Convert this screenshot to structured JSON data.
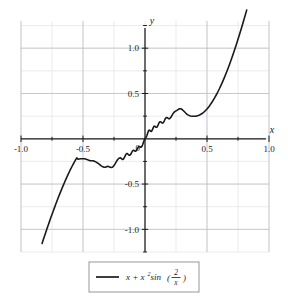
{
  "chart_data": {
    "type": "line",
    "title": "",
    "subtitle": "",
    "xlabel": "x",
    "ylabel": "y",
    "xlim": [
      -1.0,
      1.0
    ],
    "ylim": [
      -1.25,
      1.3
    ],
    "grid": true,
    "grid_major_step": 0.5,
    "grid_minor_step": 0.25,
    "legend_position": "bottom-center",
    "axes_style": "centered-cross",
    "xticks": [
      -1.0,
      -0.5,
      0.5,
      1.0
    ],
    "xtick_labels": [
      "-1.0",
      "-0.5",
      "0.5",
      "1.0"
    ],
    "yticks": [
      1.0,
      0.5,
      -0.5,
      -1.0
    ],
    "ytick_labels": [
      "1.0",
      "0.5",
      "-0.5",
      "-1.0"
    ],
    "origin_label": "0",
    "series": [
      {
        "name": "x + x^2 sin(2/x)",
        "color": "#1a1a1a",
        "linewidth": 1.6,
        "x_domain": [
          -0.83,
          0.82
        ],
        "formula_parts": {
          "lead": "x + x",
          "exponent": "2",
          "func": " sin",
          "frac_numerator": "2",
          "frac_denominator": "x"
        },
        "annotations": [
          {
            "label": "local maximum",
            "x": -0.42,
            "y": -0.24
          },
          {
            "label": "local minimum",
            "x": -0.26,
            "y": -0.31
          },
          {
            "label": "local maximum",
            "x": 0.28,
            "y": 0.33
          },
          {
            "label": "local minimum",
            "x": 0.42,
            "y": 0.25
          },
          {
            "label": "inflection near origin",
            "x": 0.0,
            "y": 0.0
          }
        ],
        "points": [
          [
            -0.83,
            -1.155
          ],
          [
            -0.82,
            -1.113
          ],
          [
            -0.81,
            -1.072
          ],
          [
            -0.8,
            -1.031
          ],
          [
            -0.79,
            -0.991
          ],
          [
            -0.78,
            -0.951
          ],
          [
            -0.77,
            -0.912
          ],
          [
            -0.76,
            -0.873
          ],
          [
            -0.75,
            -0.835
          ],
          [
            -0.74,
            -0.797
          ],
          [
            -0.73,
            -0.76
          ],
          [
            -0.72,
            -0.723
          ],
          [
            -0.71,
            -0.687
          ],
          [
            -0.7,
            -0.652
          ],
          [
            -0.69,
            -0.617
          ],
          [
            -0.68,
            -0.583
          ],
          [
            -0.67,
            -0.549
          ],
          [
            -0.66,
            -0.517
          ],
          [
            -0.65,
            -0.485
          ],
          [
            -0.64,
            -0.453
          ],
          [
            -0.63,
            -0.423
          ],
          [
            -0.62,
            -0.393
          ],
          [
            -0.61,
            -0.364
          ],
          [
            -0.6,
            -0.336
          ],
          [
            -0.59,
            -0.309
          ],
          [
            -0.58,
            -0.283
          ],
          [
            -0.57,
            -0.258
          ],
          [
            -0.56,
            -0.234
          ],
          [
            -0.55,
            -0.211
          ],
          [
            -0.54,
            -0.226
          ],
          [
            -0.53,
            -0.223
          ],
          [
            -0.52,
            -0.221
          ],
          [
            -0.51,
            -0.22
          ],
          [
            -0.5,
            -0.22
          ],
          [
            -0.49,
            -0.221
          ],
          [
            -0.48,
            -0.224
          ],
          [
            -0.47,
            -0.228
          ],
          [
            -0.46,
            -0.233
          ],
          [
            -0.45,
            -0.239
          ],
          [
            -0.44,
            -0.241
          ],
          [
            -0.43,
            -0.242
          ],
          [
            -0.42,
            -0.243
          ],
          [
            -0.41,
            -0.247
          ],
          [
            -0.4,
            -0.253
          ],
          [
            -0.39,
            -0.261
          ],
          [
            -0.38,
            -0.27
          ],
          [
            -0.37,
            -0.28
          ],
          [
            -0.36,
            -0.291
          ],
          [
            -0.35,
            -0.302
          ],
          [
            -0.34,
            -0.31
          ],
          [
            -0.33,
            -0.315
          ],
          [
            -0.32,
            -0.314
          ],
          [
            -0.31,
            -0.308
          ],
          [
            -0.3,
            -0.304
          ],
          [
            -0.29,
            -0.308
          ],
          [
            -0.28,
            -0.315
          ],
          [
            -0.27,
            -0.318
          ],
          [
            -0.26,
            -0.312
          ],
          [
            -0.25,
            -0.296
          ],
          [
            -0.24,
            -0.274
          ],
          [
            -0.23,
            -0.25
          ],
          [
            -0.22,
            -0.229
          ],
          [
            -0.21,
            -0.215
          ],
          [
            -0.2,
            -0.21
          ],
          [
            -0.195,
            -0.213
          ],
          [
            -0.19,
            -0.219
          ],
          [
            -0.185,
            -0.225
          ],
          [
            -0.18,
            -0.228
          ],
          [
            -0.175,
            -0.225
          ],
          [
            -0.17,
            -0.216
          ],
          [
            -0.165,
            -0.203
          ],
          [
            -0.16,
            -0.188
          ],
          [
            -0.155,
            -0.175
          ],
          [
            -0.15,
            -0.166
          ],
          [
            -0.145,
            -0.163
          ],
          [
            -0.14,
            -0.166
          ],
          [
            -0.135,
            -0.173
          ],
          [
            -0.13,
            -0.18
          ],
          [
            -0.125,
            -0.183
          ],
          [
            -0.12,
            -0.18
          ],
          [
            -0.115,
            -0.171
          ],
          [
            -0.11,
            -0.158
          ],
          [
            -0.105,
            -0.145
          ],
          [
            -0.1,
            -0.134
          ],
          [
            -0.095,
            -0.128
          ],
          [
            -0.09,
            -0.128
          ],
          [
            -0.085,
            -0.132
          ],
          [
            -0.08,
            -0.136
          ],
          [
            -0.075,
            -0.136
          ],
          [
            -0.07,
            -0.13
          ],
          [
            -0.065,
            -0.119
          ],
          [
            -0.06,
            -0.106
          ],
          [
            -0.055,
            -0.094
          ],
          [
            -0.05,
            -0.087
          ],
          [
            -0.045,
            -0.086
          ],
          [
            -0.04,
            -0.089
          ],
          [
            -0.035,
            -0.093
          ],
          [
            -0.03,
            -0.092
          ],
          [
            -0.025,
            -0.084
          ],
          [
            -0.02,
            -0.069
          ],
          [
            -0.015,
            -0.05
          ],
          [
            -0.01,
            -0.03
          ],
          [
            -0.005,
            -0.012
          ],
          [
            0.0,
            0.0
          ],
          [
            0.005,
            0.01
          ],
          [
            0.01,
            0.02
          ],
          [
            0.015,
            0.035
          ],
          [
            0.02,
            0.056
          ],
          [
            0.025,
            0.077
          ],
          [
            0.03,
            0.092
          ],
          [
            0.035,
            0.096
          ],
          [
            0.04,
            0.091
          ],
          [
            0.045,
            0.083
          ],
          [
            0.05,
            0.08
          ],
          [
            0.055,
            0.086
          ],
          [
            0.06,
            0.1
          ],
          [
            0.065,
            0.117
          ],
          [
            0.07,
            0.132
          ],
          [
            0.075,
            0.139
          ],
          [
            0.08,
            0.138
          ],
          [
            0.085,
            0.132
          ],
          [
            0.09,
            0.127
          ],
          [
            0.095,
            0.128
          ],
          [
            0.1,
            0.136
          ],
          [
            0.105,
            0.15
          ],
          [
            0.11,
            0.166
          ],
          [
            0.115,
            0.18
          ],
          [
            0.12,
            0.188
          ],
          [
            0.125,
            0.188
          ],
          [
            0.13,
            0.183
          ],
          [
            0.135,
            0.177
          ],
          [
            0.14,
            0.173
          ],
          [
            0.145,
            0.175
          ],
          [
            0.15,
            0.183
          ],
          [
            0.155,
            0.196
          ],
          [
            0.16,
            0.211
          ],
          [
            0.165,
            0.224
          ],
          [
            0.17,
            0.233
          ],
          [
            0.175,
            0.235
          ],
          [
            0.18,
            0.233
          ],
          [
            0.185,
            0.227
          ],
          [
            0.19,
            0.222
          ],
          [
            0.195,
            0.22
          ],
          [
            0.2,
            0.223
          ],
          [
            0.21,
            0.239
          ],
          [
            0.22,
            0.263
          ],
          [
            0.23,
            0.285
          ],
          [
            0.24,
            0.3
          ],
          [
            0.25,
            0.308
          ],
          [
            0.26,
            0.315
          ],
          [
            0.27,
            0.325
          ],
          [
            0.28,
            0.332
          ],
          [
            0.29,
            0.331
          ],
          [
            0.3,
            0.322
          ],
          [
            0.31,
            0.309
          ],
          [
            0.32,
            0.295
          ],
          [
            0.33,
            0.281
          ],
          [
            0.34,
            0.27
          ],
          [
            0.35,
            0.261
          ],
          [
            0.36,
            0.255
          ],
          [
            0.37,
            0.251
          ],
          [
            0.38,
            0.249
          ],
          [
            0.39,
            0.248
          ],
          [
            0.4,
            0.249
          ],
          [
            0.41,
            0.25
          ],
          [
            0.42,
            0.253
          ],
          [
            0.43,
            0.257
          ],
          [
            0.44,
            0.263
          ],
          [
            0.45,
            0.27
          ],
          [
            0.46,
            0.279
          ],
          [
            0.47,
            0.289
          ],
          [
            0.48,
            0.301
          ],
          [
            0.49,
            0.314
          ],
          [
            0.5,
            0.329
          ],
          [
            0.52,
            0.363
          ],
          [
            0.54,
            0.403
          ],
          [
            0.56,
            0.448
          ],
          [
            0.58,
            0.497
          ],
          [
            0.6,
            0.552
          ],
          [
            0.62,
            0.611
          ],
          [
            0.64,
            0.675
          ],
          [
            0.66,
            0.743
          ],
          [
            0.68,
            0.815
          ],
          [
            0.7,
            0.891
          ],
          [
            0.72,
            0.971
          ],
          [
            0.74,
            1.055
          ],
          [
            0.76,
            1.142
          ],
          [
            0.78,
            1.232
          ],
          [
            0.8,
            1.325
          ],
          [
            0.82,
            1.42
          ]
        ]
      }
    ]
  },
  "legend": {
    "entry_label": "x + x² sin(2/x)"
  },
  "colors": {
    "curve": "#1a1a1a",
    "axis": "#1a1a1a",
    "grid_major": "#b9b9c4",
    "grid_minor": "#e2e2ea",
    "legend_border": "#8a8a96",
    "background": "#ffffff"
  }
}
